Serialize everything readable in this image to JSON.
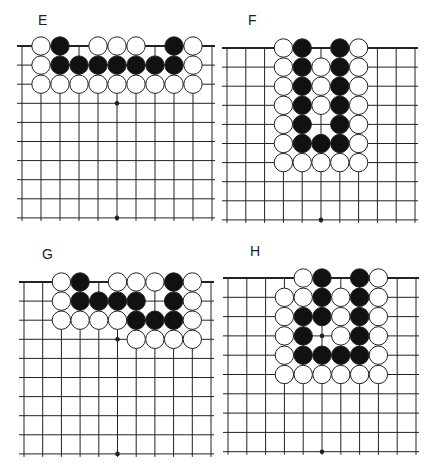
{
  "colors": {
    "line": "#222222",
    "black_stone": "#111111",
    "white_stone": "#ffffff",
    "background": "#ffffff"
  },
  "panels": [
    {
      "label": "E",
      "label_pos": [
        38,
        12
      ],
      "x0": 22,
      "y0": 46,
      "dx": 19,
      "dy": 19.1,
      "cols": 11,
      "rows": 10,
      "top_edge_extend_left": 5,
      "star_points": [
        [
          5,
          3
        ],
        [
          5,
          9
        ]
      ],
      "stones": [
        [
          "W",
          1,
          0
        ],
        [
          "B",
          2,
          0
        ],
        [
          "W",
          4,
          0
        ],
        [
          "W",
          5,
          0
        ],
        [
          "W",
          6,
          0
        ],
        [
          "B",
          8,
          0
        ],
        [
          "W",
          9,
          0
        ],
        [
          "W",
          1,
          1
        ],
        [
          "B",
          2,
          1
        ],
        [
          "B",
          3,
          1
        ],
        [
          "B",
          4,
          1
        ],
        [
          "B",
          5,
          1
        ],
        [
          "B",
          6,
          1
        ],
        [
          "B",
          7,
          1
        ],
        [
          "B",
          8,
          1
        ],
        [
          "W",
          9,
          1
        ],
        [
          "W",
          1,
          2
        ],
        [
          "W",
          2,
          2
        ],
        [
          "W",
          3,
          2
        ],
        [
          "W",
          4,
          2
        ],
        [
          "W",
          5,
          2
        ],
        [
          "W",
          6,
          2
        ],
        [
          "W",
          7,
          2
        ],
        [
          "W",
          8,
          2
        ],
        [
          "W",
          9,
          2
        ]
      ]
    },
    {
      "label": "F",
      "label_pos": [
        248,
        12
      ],
      "x0": 227,
      "y0": 48,
      "dx": 18.8,
      "dy": 19.1,
      "cols": 11,
      "rows": 10,
      "top_edge_extend_left": 5,
      "star_points": [
        [
          5,
          9
        ]
      ],
      "stones": [
        [
          "W",
          3,
          0
        ],
        [
          "B",
          4,
          0
        ],
        [
          "B",
          6,
          0
        ],
        [
          "W",
          7,
          0
        ],
        [
          "W",
          3,
          1
        ],
        [
          "B",
          4,
          1
        ],
        [
          "W",
          5,
          1
        ],
        [
          "B",
          6,
          1
        ],
        [
          "W",
          7,
          1
        ],
        [
          "W",
          3,
          2
        ],
        [
          "B",
          4,
          2
        ],
        [
          "W",
          5,
          2
        ],
        [
          "B",
          6,
          2
        ],
        [
          "W",
          7,
          2
        ],
        [
          "W",
          3,
          3
        ],
        [
          "B",
          4,
          3
        ],
        [
          "W",
          5,
          3
        ],
        [
          "B",
          6,
          3
        ],
        [
          "W",
          7,
          3
        ],
        [
          "W",
          3,
          4
        ],
        [
          "B",
          4,
          4
        ],
        [
          "B",
          6,
          4
        ],
        [
          "W",
          7,
          4
        ],
        [
          "W",
          3,
          5
        ],
        [
          "B",
          4,
          5
        ],
        [
          "B",
          5,
          5
        ],
        [
          "B",
          6,
          5
        ],
        [
          "W",
          7,
          5
        ],
        [
          "W",
          3,
          6
        ],
        [
          "W",
          4,
          6
        ],
        [
          "W",
          5,
          6
        ],
        [
          "W",
          6,
          6
        ],
        [
          "W",
          7,
          6
        ]
      ]
    },
    {
      "label": "G",
      "label_pos": [
        42,
        246
      ],
      "x0": 24,
      "y0": 282,
      "dx": 18.7,
      "dy": 19.1,
      "cols": 11,
      "rows": 10,
      "top_edge_extend_left": 5,
      "star_points": [
        [
          5,
          3
        ],
        [
          5,
          9
        ]
      ],
      "stones": [
        [
          "W",
          2,
          0
        ],
        [
          "B",
          3,
          0
        ],
        [
          "W",
          5,
          0
        ],
        [
          "W",
          6,
          0
        ],
        [
          "W",
          7,
          0
        ],
        [
          "B",
          8,
          0
        ],
        [
          "W",
          9,
          0
        ],
        [
          "W",
          2,
          1
        ],
        [
          "B",
          3,
          1
        ],
        [
          "B",
          4,
          1
        ],
        [
          "B",
          5,
          1
        ],
        [
          "B",
          6,
          1
        ],
        [
          "B",
          8,
          1
        ],
        [
          "W",
          9,
          1
        ],
        [
          "W",
          2,
          2
        ],
        [
          "W",
          3,
          2
        ],
        [
          "W",
          4,
          2
        ],
        [
          "W",
          5,
          2
        ],
        [
          "B",
          6,
          2
        ],
        [
          "B",
          7,
          2
        ],
        [
          "B",
          8,
          2
        ],
        [
          "W",
          9,
          2
        ],
        [
          "W",
          6,
          3
        ],
        [
          "W",
          7,
          3
        ],
        [
          "W",
          8,
          3
        ],
        [
          "W",
          9,
          3
        ]
      ]
    },
    {
      "label": "H",
      "label_pos": [
        250,
        243
      ],
      "x0": 228,
      "y0": 278,
      "dx": 18.8,
      "dy": 19.3,
      "cols": 11,
      "rows": 10,
      "top_edge_extend_left": 5,
      "star_points": [
        [
          5,
          3
        ],
        [
          5,
          9
        ]
      ],
      "stones": [
        [
          "W",
          4,
          0
        ],
        [
          "B",
          5,
          0
        ],
        [
          "B",
          7,
          0
        ],
        [
          "W",
          8,
          0
        ],
        [
          "W",
          3,
          1
        ],
        [
          "W",
          4,
          1
        ],
        [
          "B",
          5,
          1
        ],
        [
          "W",
          6,
          1
        ],
        [
          "B",
          7,
          1
        ],
        [
          "W",
          8,
          1
        ],
        [
          "W",
          3,
          2
        ],
        [
          "B",
          4,
          2
        ],
        [
          "B",
          5,
          2
        ],
        [
          "W",
          6,
          2
        ],
        [
          "B",
          7,
          2
        ],
        [
          "W",
          8,
          2
        ],
        [
          "W",
          3,
          3
        ],
        [
          "B",
          4,
          3
        ],
        [
          "W",
          6,
          3
        ],
        [
          "B",
          7,
          3
        ],
        [
          "W",
          8,
          3
        ],
        [
          "W",
          3,
          4
        ],
        [
          "B",
          4,
          4
        ],
        [
          "B",
          5,
          4
        ],
        [
          "B",
          6,
          4
        ],
        [
          "B",
          7,
          4
        ],
        [
          "W",
          8,
          4
        ],
        [
          "W",
          3,
          5
        ],
        [
          "W",
          4,
          5
        ],
        [
          "W",
          5,
          5
        ],
        [
          "W",
          6,
          5
        ],
        [
          "W",
          7,
          5
        ],
        [
          "W",
          8,
          5
        ]
      ]
    }
  ]
}
